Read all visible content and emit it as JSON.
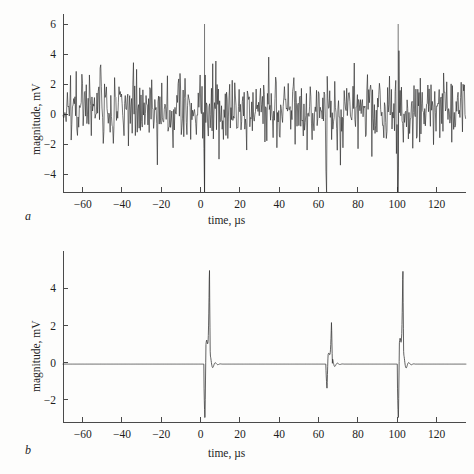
{
  "figure": {
    "panels": [
      {
        "letter": "a",
        "caption_letter": "a",
        "xlabel": "time, µs",
        "ylabel": "magnitude, mV",
        "xticks": [
          -60,
          -40,
          -20,
          0,
          20,
          40,
          60,
          80,
          100,
          120
        ],
        "xtick_labels": [
          "−60",
          "−40",
          "−20",
          "0",
          "20",
          "40",
          "60",
          "80",
          "100",
          "120"
        ],
        "yticks": [
          6,
          4,
          2,
          0,
          -2,
          -4
        ],
        "ytick_labels": [
          "6",
          "4",
          "2",
          "0",
          "−2",
          "−4"
        ]
      },
      {
        "letter": "b",
        "caption_letter": "b",
        "xlabel": "time, µs",
        "ylabel": "magnitude, mV",
        "xticks": [
          -60,
          -40,
          -20,
          0,
          20,
          40,
          60,
          80,
          100,
          120
        ],
        "xtick_labels": [
          "−60",
          "−40",
          "−20",
          "0",
          "20",
          "40",
          "60",
          "80",
          "100",
          "120"
        ],
        "yticks": [
          4,
          2,
          0,
          -2
        ],
        "ytick_labels": [
          "4",
          "2",
          "0",
          "−2"
        ]
      }
    ]
  },
  "colors": {
    "background": "#fdfdfc",
    "axis": "#4a4a4a",
    "trace_a": "#2b2b2b",
    "trace_b": "#3a3a3a",
    "text": "#1e1e1e"
  },
  "chart_data": [
    {
      "type": "line",
      "panel": "a",
      "title": "",
      "xlabel": "time, µs",
      "ylabel": "magnitude, mV",
      "xlim": [
        -70,
        135
      ],
      "ylim": [
        -5.2,
        6.4
      ],
      "xticks": [
        -60,
        -40,
        -20,
        0,
        20,
        40,
        60,
        80,
        100,
        120
      ],
      "yticks": [
        6,
        4,
        2,
        0,
        -2,
        -4
      ],
      "grid": false,
      "legend": null,
      "description": "Raw received waveform: broadband noise of roughly ±3 mV standard envelope with occasional excursions to +6 and −5 mV; three buried correlation events near t = 2, 64 and 100 µs, the ones at 2 and 100 µs visible as tall isolated spikes.",
      "series": [
        {
          "name": "noise + buried pulses",
          "noise_rms": 1.2,
          "noise_mean": 0.35,
          "envelope_typical": [
            -2.6,
            3.1
          ],
          "envelope_extreme": [
            -5.0,
            6.1
          ],
          "sample_interval_us": 0.32,
          "events": [
            {
              "t": 2.0,
              "peak": 6.0,
              "trough": -5.1,
              "label": "pulse 1"
            },
            {
              "t": 64.0,
              "peak": 4.3,
              "trough": -3.2,
              "label": "pulse 2 (buried)"
            },
            {
              "t": 100.5,
              "peak": 6.0,
              "trough": -5.1,
              "label": "pulse 3"
            }
          ]
        }
      ]
    },
    {
      "type": "line",
      "panel": "b",
      "title": "",
      "xlabel": "time, µs",
      "ylabel": "magnitude, mV",
      "xlim": [
        -70,
        135
      ],
      "ylim": [
        -3.2,
        5.8
      ],
      "xticks": [
        -60,
        -40,
        -20,
        0,
        20,
        40,
        60,
        80,
        100,
        120
      ],
      "yticks": [
        4,
        2,
        0,
        -2
      ],
      "grid": false,
      "legend": null,
      "description": "Matched-filter / compressed output: flat zero baseline with three sharp bipolar pulses. Each pulse dips sharply negative then rises to a narrow positive peak followed by small ringing sidelobes.",
      "series": [
        {
          "name": "compressed output",
          "baseline": -0.08,
          "pulses": [
            {
              "t": 2.2,
              "peak": 5.5,
              "trough": -3.2,
              "shoulder": 1.3,
              "sidelobe": 0.45,
              "label": "pulse 1"
            },
            {
              "t": 64.3,
              "peak": 2.4,
              "trough": -1.35,
              "shoulder": 0.6,
              "sidelobe": 0.3,
              "label": "pulse 2"
            },
            {
              "t": 100.6,
              "peak": 5.45,
              "trough": -3.2,
              "shoulder": 1.4,
              "sidelobe": 0.5,
              "label": "pulse 3"
            }
          ]
        }
      ]
    }
  ]
}
